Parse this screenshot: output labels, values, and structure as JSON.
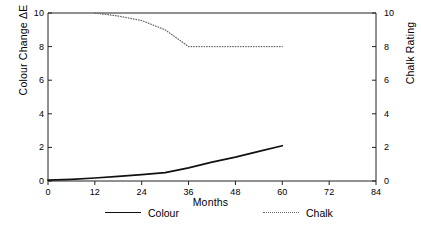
{
  "chart_data": {
    "type": "line",
    "title": "",
    "xlabel": "Months",
    "ylabel": "Colour Change ΔE",
    "y2label": "Chalk Rating",
    "xlim": [
      0,
      84
    ],
    "ylim": [
      0,
      10
    ],
    "y2lim": [
      0,
      10
    ],
    "xticks": [
      0,
      12,
      24,
      36,
      48,
      60,
      72,
      84
    ],
    "yticks": [
      0,
      2,
      4,
      6,
      8,
      10
    ],
    "y2ticks": [
      0,
      2,
      4,
      6,
      8,
      10
    ],
    "xticklabels": [
      "0",
      "12",
      "24",
      "36",
      "48",
      "60",
      "72",
      "84"
    ],
    "yticklabels": [
      "0",
      "2",
      "4",
      "6",
      "8",
      "10"
    ],
    "y2ticklabels": [
      "0",
      "2",
      "4",
      "6",
      "8",
      "10"
    ],
    "grid": false,
    "legend_position": "below",
    "series": [
      {
        "name": "Colour",
        "axis": "left",
        "style": "solid",
        "color": "#111111",
        "x": [
          0,
          6,
          12,
          18,
          24,
          30,
          36,
          42,
          48,
          54,
          60
        ],
        "values": [
          0.05,
          0.1,
          0.18,
          0.27,
          0.38,
          0.5,
          0.78,
          1.12,
          1.42,
          1.76,
          2.1
        ]
      },
      {
        "name": "Chalk",
        "axis": "right",
        "style": "dotted",
        "color": "#6b6b6b",
        "x": [
          12,
          18,
          24,
          30,
          36,
          42,
          48,
          54,
          60
        ],
        "values": [
          10.0,
          9.82,
          9.55,
          9.0,
          8.0,
          8.0,
          8.0,
          8.0,
          8.0
        ]
      }
    ]
  },
  "axes": {
    "xlabel": "Months",
    "ylabel_left": "Colour Change ΔE",
    "ylabel_right": "Chalk Rating"
  },
  "legend": {
    "entries": [
      {
        "label": "Colour",
        "style": "solid"
      },
      {
        "label": "Chalk",
        "style": "dotted"
      }
    ]
  }
}
